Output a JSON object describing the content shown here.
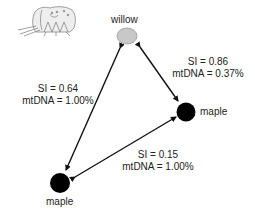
{
  "nodes": {
    "willow": {
      "label": "willow",
      "color": "#c8c8c8"
    },
    "maple_right": {
      "label": "maple",
      "color": "#000000"
    },
    "maple_bottom": {
      "label": "maple",
      "color": "#000000"
    }
  },
  "edges": {
    "willow_maple_bottom": {
      "si": "SI = 0.64",
      "mtdna": "mtDNA = 1.00%"
    },
    "willow_maple_right": {
      "si": "SI = 0.86",
      "mtdna": "mtDNA = 0.37%"
    },
    "maple_bottom_maple_right": {
      "si": "SI = 0.15",
      "mtdna": "mtDNA = 1.00%"
    }
  },
  "illustration": {
    "icon": "insect-icon"
  }
}
